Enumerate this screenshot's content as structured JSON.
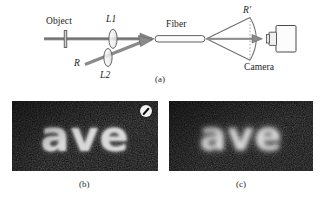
{
  "figure": {
    "type": "scientific-figure",
    "panels": [
      {
        "id": "a",
        "caption": "(a)",
        "kind": "schematic",
        "description": "Optical setup: object illuminated through lenses L1 and L2 into a fiber, output cone imaged onto a camera"
      },
      {
        "id": "b",
        "caption": "(b)",
        "kind": "photograph",
        "image_text": "ave"
      },
      {
        "id": "c",
        "caption": "(c)",
        "kind": "photograph",
        "image_text": "ave"
      }
    ]
  },
  "schematic": {
    "labels": {
      "object": "Object",
      "lens1": "L1",
      "lens2": "L2",
      "reference": "R",
      "fiber": "Fiber",
      "reference_prime": "R′",
      "camera": "Camera"
    },
    "icons": {
      "object": "object-plane-icon",
      "lens1": "lens-icon",
      "lens2": "lens-icon",
      "fiber": "optical-fiber-icon",
      "camera": "camera-icon",
      "beam": "beam-arrow-icon",
      "reference_beam": "reference-beam-arrow-icon",
      "wavefront": "spherical-wavefront-icon"
    },
    "colors": {
      "line": "#6f6f6f",
      "outline": "#555555",
      "fill": "#e9e9e9",
      "background": "#ffffff"
    }
  },
  "photos": {
    "b": {
      "word": "ave",
      "caption": "(b)",
      "background": "#111111",
      "text_color": "#d8d8d8",
      "marker": {
        "name": "no-entry-badge-icon",
        "present": true
      }
    },
    "c": {
      "word": "ave",
      "caption": "(c)",
      "background": "#111111",
      "text_color": "#cfcfcf",
      "marker": {
        "name": "no-entry-badge-icon",
        "present": false
      }
    }
  }
}
